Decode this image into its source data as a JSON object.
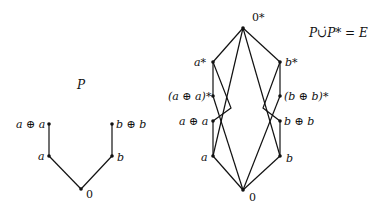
{
  "diagram_p": {
    "title": "P",
    "nodes": {
      "apa": "a ⊕ a",
      "bpb": "b ⊕ b",
      "a": "a",
      "b": "b",
      "zero": "0"
    }
  },
  "diagram_e": {
    "title": "P∪̇P* = E",
    "nodes": {
      "zero_star": "0*",
      "a_star": "a*",
      "b_star": "b*",
      "apa_star": "(a ⊕ a)*",
      "bpb_star": "(b ⊕ b)*",
      "apa": "a ⊕ a",
      "bpb": "b ⊕ b",
      "a": "a",
      "b": "b",
      "zero": "0"
    }
  },
  "colors": {
    "stroke": "#111111",
    "background": "#ffffff"
  }
}
